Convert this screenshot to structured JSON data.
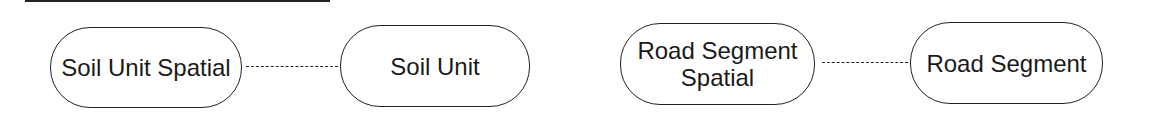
{
  "diagram": {
    "nodes": [
      {
        "id": "n1",
        "label": "Soil Unit Spatial"
      },
      {
        "id": "n2",
        "label": "Soil Unit"
      },
      {
        "id": "n3",
        "label": "Road Segment Spatial"
      },
      {
        "id": "n4",
        "label": "Road Segment"
      }
    ],
    "edges": [
      {
        "from": "n1",
        "to": "n2",
        "style": "dashed"
      },
      {
        "from": "n3",
        "to": "n4",
        "style": "dashed"
      }
    ],
    "line_color": "#222222",
    "background": "#ffffff"
  }
}
